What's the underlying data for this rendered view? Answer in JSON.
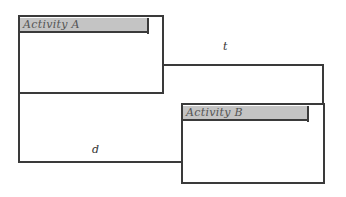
{
  "diagram": {
    "activities": [
      {
        "id": "A",
        "label": "Activity A"
      },
      {
        "id": "B",
        "label": "Activity B"
      }
    ],
    "connectors": [
      {
        "from": "A",
        "to": "B",
        "label": "t",
        "route": "A right edge → right → down to top of B"
      },
      {
        "from": "A",
        "to": "B",
        "label": "d",
        "route": "A left edge → down → right to left edge of B"
      }
    ],
    "colors": {
      "line": "#3a3a3a",
      "header_fill": "#c4c4c4"
    }
  }
}
